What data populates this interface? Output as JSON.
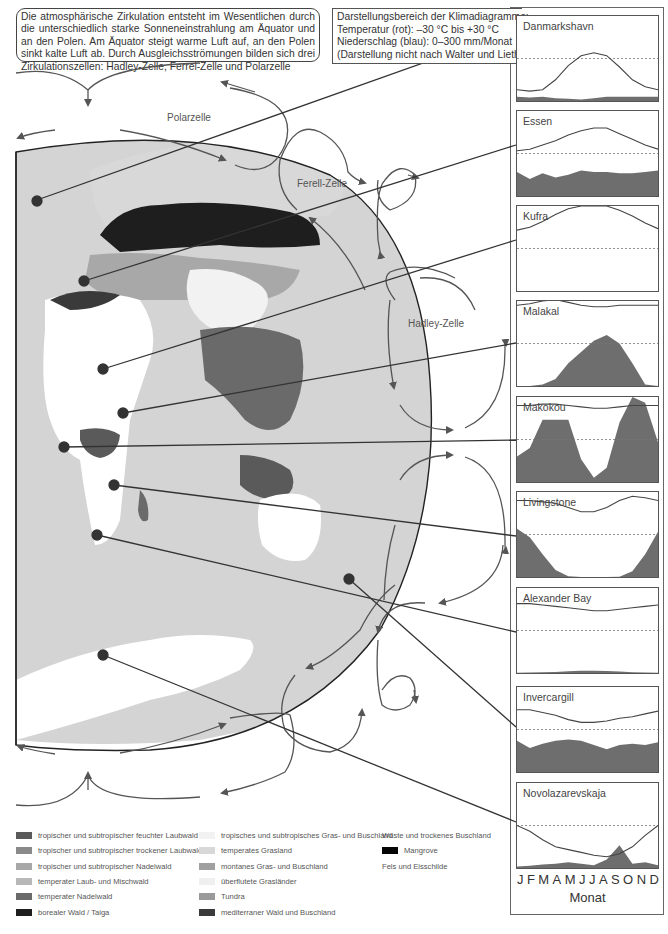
{
  "intro_text": "Die atmosphärische Zirkulation entsteht im Wesentlichen durch die unterschiedlich starke Sonneneinstrahlung am Äquator und an den Polen. Am Äquator steigt warme Luft auf, an den Polen sinkt kalte Luft ab. Durch Ausgleichsströmungen bilden sich drei Zirkulationszellen: Hadley-Zelle, Ferrel-Zelle und Polarzelle",
  "range_box": {
    "line1": "Darstellungsbereich der Klimadiagramme:",
    "line2": "Temperatur (rot): –30 °C bis +30 °C",
    "line3": "Niederschlag (blau): 0–300 mm/Monat",
    "line4": "(Darstellung nicht nach Walter und Lieth)"
  },
  "cells": {
    "polar": "Polarzelle",
    "ferrel": "Ferell-Zelle",
    "hadley": "Hadley-Zelle"
  },
  "axis": {
    "months": [
      "J",
      "F",
      "M",
      "A",
      "M",
      "J",
      "J",
      "A",
      "S",
      "O",
      "N",
      "D"
    ],
    "label": "Monat"
  },
  "colors": {
    "temperature_line": "#444444",
    "precipitation_fill": "#6e6e6e",
    "zero_line": "#777777",
    "ocean": "#d4d4d4",
    "outline": "#222222"
  },
  "chart_data": {
    "type": "line+area (climate diagrams)",
    "title": "Klimadiagramme",
    "xlabel": "Monat",
    "temperature_range_c": [
      -30,
      30
    ],
    "precipitation_range_mm": [
      0,
      300
    ],
    "categories": [
      "J",
      "F",
      "M",
      "A",
      "M",
      "J",
      "J",
      "A",
      "S",
      "O",
      "N",
      "D"
    ],
    "stations": [
      {
        "name": "Danmarkshavn",
        "temperature_c": [
          -22,
          -23,
          -22,
          -15,
          -5,
          2,
          4,
          2,
          -6,
          -15,
          -20,
          -22
        ],
        "precip_mm": [
          15,
          12,
          15,
          10,
          8,
          5,
          10,
          15,
          15,
          15,
          15,
          15
        ]
      },
      {
        "name": "Essen",
        "temperature_c": [
          2,
          3,
          6,
          9,
          13,
          16,
          18,
          18,
          14,
          10,
          6,
          3
        ],
        "precip_mm": [
          85,
          60,
          80,
          65,
          75,
          90,
          85,
          85,
          80,
          80,
          85,
          90
        ]
      },
      {
        "name": "Kufra",
        "temperature_c": [
          13,
          15,
          19,
          24,
          28,
          30,
          30,
          30,
          27,
          23,
          18,
          14
        ],
        "precip_mm": [
          0,
          0,
          0,
          0,
          0,
          0,
          0,
          0,
          0,
          0,
          0,
          0
        ]
      },
      {
        "name": "Malakal",
        "temperature_c": [
          27,
          28,
          30,
          31,
          29,
          27,
          26,
          26,
          27,
          27,
          27,
          27
        ],
        "precip_mm": [
          0,
          0,
          5,
          25,
          80,
          120,
          160,
          180,
          150,
          80,
          5,
          0
        ]
      },
      {
        "name": "Makokou",
        "temperature_c": [
          24,
          24,
          25,
          25,
          24,
          23,
          22,
          22,
          23,
          24,
          24,
          24
        ],
        "precip_mm": [
          90,
          120,
          220,
          220,
          220,
          80,
          15,
          50,
          210,
          300,
          280,
          140
        ]
      },
      {
        "name": "Livingstone",
        "temperature_c": [
          24,
          24,
          23,
          22,
          19,
          16,
          16,
          19,
          24,
          27,
          26,
          24
        ],
        "precip_mm": [
          170,
          140,
          80,
          25,
          3,
          0,
          0,
          0,
          1,
          20,
          80,
          160
        ]
      },
      {
        "name": "Alexander Bay",
        "temperature_c": [
          19,
          19,
          18,
          17,
          16,
          15,
          14,
          14,
          15,
          16,
          17,
          18
        ],
        "precip_mm": [
          1,
          2,
          3,
          4,
          6,
          8,
          8,
          7,
          5,
          3,
          2,
          1
        ]
      },
      {
        "name": "Invercargill",
        "temperature_c": [
          14,
          14,
          12,
          10,
          7,
          5,
          5,
          6,
          8,
          9,
          11,
          13
        ],
        "precip_mm": [
          110,
          85,
          100,
          110,
          115,
          110,
          95,
          80,
          95,
          100,
          95,
          105
        ]
      },
      {
        "name": "Novolazarevskaja",
        "temperature_c": [
          0,
          -4,
          -10,
          -15,
          -17,
          -19,
          -21,
          -22,
          -20,
          -15,
          -7,
          0
        ],
        "precip_mm": [
          5,
          8,
          12,
          15,
          20,
          15,
          10,
          30,
          80,
          15,
          20,
          10
        ]
      }
    ]
  },
  "legend": {
    "col1": [
      {
        "label": "tropischer und subtropischer feuchter Laubwald",
        "color": "#5a5a5a"
      },
      {
        "label": "tropischer und subtropischer trockener Laubwald",
        "color": "#8a8a8a"
      },
      {
        "label": "tropischer und subtropischer Nadelwald",
        "color": "#a8a8a8"
      },
      {
        "label": "temperater Laub- und Mischwald",
        "color": "#b8b8b8"
      },
      {
        "label": "temperater Nadelwald",
        "color": "#6a6a6a"
      },
      {
        "label": "borealer Wald / Taiga",
        "color": "#1e1e1e"
      }
    ],
    "col2": [
      {
        "label": "tropisches und subtropisches Gras- und Buschland",
        "color": "#f2f2f2"
      },
      {
        "label": "temperates Grasland",
        "color": "#d8d8d8"
      },
      {
        "label": "montanes Gras- und Buschland",
        "color": "#a0a0a0"
      },
      {
        "label": "überflutete Grasländer",
        "color": "#efefef"
      },
      {
        "label": "Tundra",
        "color": "#9a9a9a"
      },
      {
        "label": "mediterraner Wald und Buschland",
        "color": "#3a3a3a"
      }
    ],
    "col3": [
      {
        "label": "Wüste und trockenes Buschland",
        "color": "#ffffff"
      },
      {
        "label": "Mangrove",
        "color": "#050505"
      },
      {
        "label": "Fels und Eisschilde",
        "color": "#ffffff"
      }
    ]
  }
}
